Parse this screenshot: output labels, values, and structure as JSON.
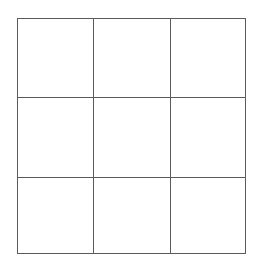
{
  "diagram": {
    "type": "grid",
    "rows": 3,
    "columns": 3,
    "line_color": "#5a5a5a",
    "background_color": "#ffffff",
    "cells": [
      [
        "",
        "",
        ""
      ],
      [
        "",
        "",
        ""
      ],
      [
        "",
        "",
        ""
      ]
    ]
  }
}
